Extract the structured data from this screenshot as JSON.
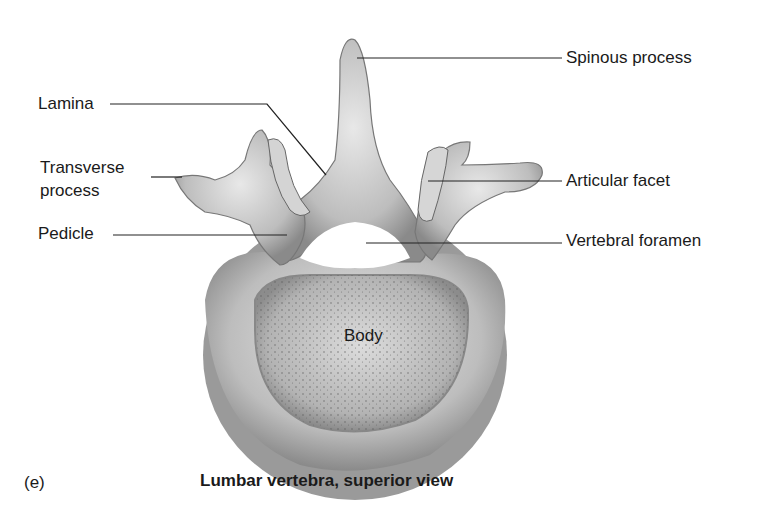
{
  "figure": {
    "tag": "(e)",
    "caption": "Lumbar vertebra, superior view"
  },
  "labels": {
    "spinous_process": "Spinous process",
    "lamina": "Lamina",
    "transverse_process_line1": "Transverse",
    "transverse_process_line2": "process",
    "articular_facet": "Articular facet",
    "pedicle": "Pedicle",
    "vertebral_foramen": "Vertebral foramen",
    "body": "Body"
  }
}
